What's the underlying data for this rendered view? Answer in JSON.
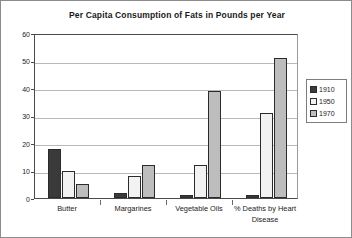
{
  "chart_data": {
    "type": "bar",
    "title": "Per Capita Consumption of Fats in Pounds per Year",
    "xlabel": "",
    "ylabel": "",
    "ylim": [
      0,
      60
    ],
    "yticks": [
      0,
      10,
      20,
      30,
      40,
      50,
      60
    ],
    "grid": true,
    "legend_position": "right",
    "categories": [
      "Butter",
      "Margarines",
      "Vegetable Oils",
      "% Deaths by Heart Disease"
    ],
    "series": [
      {
        "name": "1910",
        "color": "#3a3a3a",
        "values": [
          18,
          2,
          1,
          1
        ]
      },
      {
        "name": "1950",
        "color": "#f2f2f2",
        "values": [
          10,
          8,
          12,
          31
        ]
      },
      {
        "name": "1970",
        "color": "#bdbdbd",
        "values": [
          5,
          12,
          39,
          51
        ]
      }
    ]
  }
}
